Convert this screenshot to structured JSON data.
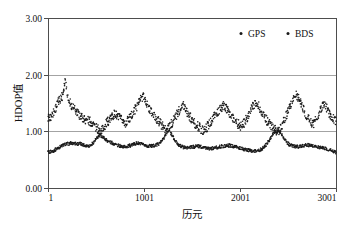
{
  "chart_data": {
    "type": "scatter",
    "title": "",
    "xlabel": "历元",
    "ylabel": "HDOP值",
    "xlim": [
      1,
      3001
    ],
    "ylim": [
      0.0,
      3.0
    ],
    "xticks": [
      1,
      1001,
      2001,
      3001
    ],
    "xtick_labels": [
      "1",
      "1001",
      "2001",
      "3001"
    ],
    "yticks": [
      0.0,
      1.0,
      2.0,
      3.0
    ],
    "ytick_labels": [
      "0.00",
      "1.00",
      "2.00",
      "3.00"
    ],
    "grid": "horizontal",
    "legend_position": "top-right",
    "marker": "dot",
    "marker_size_px": 1.6,
    "series": [
      {
        "name": "GPS",
        "color": "#1a1a1a",
        "description": "Lower dense band, HDOP mostly 0.60-0.90, rising briefly above 1.00 near epochs 1150 and 2400",
        "x": [
          1,
          31,
          61,
          91,
          121,
          151,
          181,
          211,
          241,
          271,
          301,
          331,
          361,
          391,
          421,
          451,
          481,
          511,
          541,
          571,
          601,
          631,
          661,
          691,
          721,
          751,
          781,
          811,
          841,
          871,
          901,
          931,
          961,
          991,
          1021,
          1051,
          1081,
          1111,
          1141,
          1171,
          1201,
          1231,
          1261,
          1291,
          1321,
          1351,
          1381,
          1411,
          1441,
          1471,
          1501,
          1531,
          1561,
          1591,
          1621,
          1651,
          1681,
          1711,
          1741,
          1771,
          1801,
          1831,
          1861,
          1891,
          1921,
          1951,
          1981,
          2011,
          2041,
          2071,
          2101,
          2131,
          2161,
          2191,
          2221,
          2251,
          2281,
          2311,
          2341,
          2371,
          2401,
          2431,
          2461,
          2491,
          2521,
          2551,
          2581,
          2611,
          2641,
          2671,
          2701,
          2731,
          2761,
          2791,
          2821,
          2851,
          2881,
          2911,
          2941,
          2971,
          3001
        ],
        "y": [
          0.63,
          0.64,
          0.66,
          0.69,
          0.72,
          0.75,
          0.77,
          0.78,
          0.79,
          0.79,
          0.78,
          0.78,
          0.77,
          0.75,
          0.74,
          0.76,
          0.82,
          0.88,
          0.93,
          0.9,
          0.86,
          0.82,
          0.8,
          0.78,
          0.76,
          0.74,
          0.73,
          0.73,
          0.74,
          0.76,
          0.78,
          0.79,
          0.78,
          0.76,
          0.75,
          0.74,
          0.74,
          0.75,
          0.77,
          0.8,
          0.86,
          0.95,
          1.03,
          0.94,
          0.84,
          0.78,
          0.74,
          0.72,
          0.71,
          0.71,
          0.72,
          0.73,
          0.74,
          0.73,
          0.72,
          0.71,
          0.7,
          0.7,
          0.71,
          0.72,
          0.73,
          0.74,
          0.75,
          0.75,
          0.74,
          0.73,
          0.71,
          0.7,
          0.68,
          0.67,
          0.66,
          0.65,
          0.65,
          0.66,
          0.68,
          0.72,
          0.78,
          0.86,
          0.94,
          1.0,
          1.02,
          0.97,
          0.88,
          0.8,
          0.76,
          0.74,
          0.73,
          0.73,
          0.74,
          0.75,
          0.76,
          0.75,
          0.74,
          0.73,
          0.72,
          0.71,
          0.7,
          0.69,
          0.67,
          0.65,
          0.63
        ]
      },
      {
        "name": "BDS",
        "color": "#1a1a1a",
        "description": "Upper scattered cloud, HDOP mostly 1.00-1.70 with one outlier near 1.92 around epoch 250",
        "x": [
          1,
          31,
          61,
          91,
          121,
          151,
          181,
          211,
          241,
          271,
          301,
          331,
          361,
          391,
          421,
          451,
          481,
          511,
          541,
          571,
          601,
          631,
          661,
          691,
          721,
          751,
          781,
          811,
          841,
          871,
          901,
          931,
          961,
          991,
          1021,
          1051,
          1081,
          1111,
          1141,
          1171,
          1201,
          1231,
          1261,
          1291,
          1321,
          1351,
          1381,
          1411,
          1441,
          1471,
          1501,
          1531,
          1561,
          1591,
          1621,
          1651,
          1681,
          1711,
          1741,
          1771,
          1801,
          1831,
          1861,
          1891,
          1921,
          1951,
          1981,
          2011,
          2041,
          2071,
          2101,
          2131,
          2161,
          2191,
          2221,
          2251,
          2281,
          2311,
          2341,
          2371,
          2401,
          2431,
          2461,
          2491,
          2521,
          2551,
          2581,
          2611,
          2641,
          2671,
          2701,
          2731,
          2761,
          2791,
          2821,
          2851,
          2881,
          2911,
          2941,
          2971,
          3001
        ],
        "y": [
          1.22,
          1.26,
          1.34,
          1.45,
          1.56,
          1.63,
          1.92,
          1.57,
          1.48,
          1.4,
          1.33,
          1.28,
          1.24,
          1.21,
          1.19,
          1.16,
          1.12,
          1.05,
          1.0,
          1.04,
          1.12,
          1.19,
          1.25,
          1.3,
          1.27,
          1.22,
          1.18,
          1.15,
          1.2,
          1.28,
          1.37,
          1.46,
          1.55,
          1.63,
          1.52,
          1.42,
          1.33,
          1.26,
          1.2,
          1.14,
          1.08,
          1.02,
          1.06,
          1.14,
          1.23,
          1.32,
          1.41,
          1.48,
          1.38,
          1.28,
          1.2,
          1.14,
          1.09,
          1.05,
          1.02,
          1.06,
          1.13,
          1.21,
          1.28,
          1.34,
          1.4,
          1.45,
          1.39,
          1.31,
          1.24,
          1.18,
          1.13,
          1.09,
          1.14,
          1.23,
          1.33,
          1.43,
          1.52,
          1.46,
          1.37,
          1.28,
          1.19,
          1.12,
          1.06,
          1.02,
          1.0,
          1.08,
          1.19,
          1.31,
          1.43,
          1.54,
          1.66,
          1.58,
          1.47,
          1.36,
          1.26,
          1.18,
          1.12,
          1.22,
          1.32,
          1.41,
          1.48,
          1.38,
          1.29,
          1.22,
          1.18
        ]
      }
    ],
    "legend": [
      {
        "label": "GPS",
        "marker": "dot",
        "color": "#1a1a1a"
      },
      {
        "label": "BDS",
        "marker": "dot",
        "color": "#1a1a1a"
      }
    ]
  }
}
